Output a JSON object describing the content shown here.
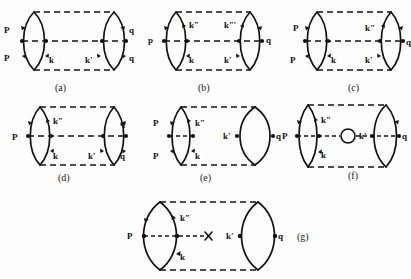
{
  "page": {
    "background_color": "#fdfdfd",
    "ink_color": "#121212",
    "width": 411,
    "height": 279
  },
  "figures": [
    {
      "id": "a",
      "caption": "(a)",
      "labels": [
        {
          "text": "P",
          "role": "left-upper"
        },
        {
          "text": "P",
          "role": "left-lower"
        },
        {
          "text": "k",
          "role": "bottom-left-inner"
        },
        {
          "text": "k'",
          "role": "bottom-right-inner"
        },
        {
          "text": "q",
          "role": "right-upper"
        },
        {
          "text": "q",
          "role": "right-lower"
        }
      ],
      "features": [
        "left-lens",
        "right-lens",
        "top-dashed-rail",
        "middle-dashed-rail",
        "bottom-dashed-rail"
      ]
    },
    {
      "id": "b",
      "caption": "(b)",
      "labels": [
        {
          "text": "kʺ",
          "role": "top-left-inner"
        },
        {
          "text": "kʺ'",
          "role": "top-right-inner"
        },
        {
          "text": "p",
          "role": "left-middle"
        },
        {
          "text": "q",
          "role": "right-middle"
        },
        {
          "text": "k",
          "role": "bottom-left-inner"
        },
        {
          "text": "k'",
          "role": "bottom-right-inner"
        }
      ],
      "features": [
        "left-lens",
        "right-lens",
        "top-dashed-rail",
        "middle-dashed-rail",
        "bottom-dashed-rail"
      ]
    },
    {
      "id": "c",
      "caption": "(c)",
      "labels": [
        {
          "text": "P",
          "role": "left-upper"
        },
        {
          "text": "P",
          "role": "left-lower"
        },
        {
          "text": "k",
          "role": "bottom-left-inner"
        },
        {
          "text": "kʺ",
          "role": "top-right-inner"
        },
        {
          "text": "k'",
          "role": "bottom-right-inner"
        },
        {
          "text": "q",
          "role": "right-middle"
        }
      ],
      "features": [
        "left-lens",
        "right-lens",
        "top-dashed-rail",
        "middle-dashed-rail",
        "bottom-dashed-rail"
      ]
    },
    {
      "id": "d",
      "caption": "(d)",
      "labels": [
        {
          "text": "kʺ",
          "role": "top-left-inner"
        },
        {
          "text": "P",
          "role": "left-middle"
        },
        {
          "text": "k",
          "role": "bottom-left-inner"
        },
        {
          "text": "k'",
          "role": "bottom-right-inner"
        },
        {
          "text": "q",
          "role": "right-upper"
        },
        {
          "text": "q",
          "role": "right-lower"
        }
      ],
      "features": [
        "left-lens",
        "right-lens",
        "top-dashed-rail",
        "middle-dashed-rail",
        "bottom-dashed-rail"
      ]
    },
    {
      "id": "e",
      "caption": "(e)",
      "labels": [
        {
          "text": "P",
          "role": "left-upper"
        },
        {
          "text": "kʺ",
          "role": "top-left-inner"
        },
        {
          "text": "P",
          "role": "left-lower"
        },
        {
          "text": "k",
          "role": "bottom-left-inner"
        },
        {
          "text": "k'",
          "role": "right-lens-left"
        },
        {
          "text": "q",
          "role": "right-lens-right"
        }
      ],
      "features": [
        "narrow-left-lens",
        "wide-right-lens",
        "top-dashed-rail",
        "short-middle-dash",
        "bottom-dashed-rail"
      ]
    },
    {
      "id": "f",
      "caption": "(f)",
      "labels": [
        {
          "text": "kʺ",
          "role": "top-left-inner"
        },
        {
          "text": "P",
          "role": "left-middle"
        },
        {
          "text": "k",
          "role": "bottom-left-inner"
        },
        {
          "text": "k'",
          "role": "right-lens-left"
        },
        {
          "text": "q",
          "role": "right-lens-right"
        }
      ],
      "features": [
        "left-lens",
        "right-lens",
        "top-dashed-rail",
        "bottom-dashed-rail",
        "middle-dash-with-bubble"
      ],
      "bubble": true
    },
    {
      "id": "g",
      "caption": "(g)",
      "labels": [
        {
          "text": "kʺ",
          "role": "top-left-inner"
        },
        {
          "text": "P",
          "role": "left-middle"
        },
        {
          "text": "k",
          "role": "bottom-left-inner"
        },
        {
          "text": "k'",
          "role": "right-lens-left"
        },
        {
          "text": "q",
          "role": "right-lens-right"
        }
      ],
      "features": [
        "left-lens",
        "right-lens",
        "top-dashed-rail",
        "bottom-dashed-rail",
        "middle-dash-with-cross"
      ],
      "cross": true
    }
  ]
}
